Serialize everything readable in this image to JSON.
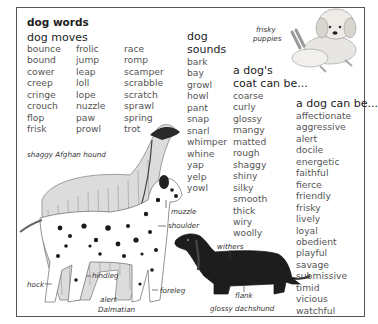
{
  "title": "dog words",
  "sections": {
    "moves": {
      "heading": "dog moves",
      "columns": [
        [
          "bounce",
          "bound",
          "cower",
          "creep",
          "cringe",
          "crouch",
          "flop",
          "frisk"
        ],
        [
          "frolic",
          "jump",
          "leap",
          "loll",
          "lope",
          "nuzzle",
          "paw",
          "prowl"
        ],
        [
          "race",
          "romp",
          "scamper",
          "scrabble",
          "scratch",
          "sprawl",
          "spring",
          "trot"
        ]
      ]
    },
    "sounds": {
      "heading_line1": "dog",
      "heading_line2": "sounds",
      "words": [
        "bark",
        "bay",
        "growl",
        "howl",
        "pant",
        "snap",
        "snarl",
        "whimper",
        "whine",
        "yap",
        "yelp",
        "yowl"
      ]
    },
    "coat": {
      "heading_line1": "a dog's",
      "heading_line2": "coat can be...",
      "words": [
        "coarse",
        "curly",
        "glossy",
        "mangy",
        "matted",
        "rough",
        "shaggy",
        "shiny",
        "silky",
        "smooth",
        "thick",
        "wiry",
        "woolly"
      ]
    },
    "traits": {
      "heading": "a dog can be...",
      "words": [
        "affectionate",
        "aggressive",
        "alert",
        "docile",
        "energetic",
        "faithful",
        "fierce",
        "friendly",
        "frisky",
        "lively",
        "loyal",
        "obedient",
        "playful",
        "savage",
        "submissive",
        "timid",
        "vicious",
        "watchful"
      ]
    }
  },
  "illustrations": {
    "puppies": {
      "caption_line1": "frisky",
      "caption_line2": "puppies"
    },
    "afghan": {
      "caption": "shaggy Afghan hound"
    },
    "dalmatian": {
      "caption_line1": "alert",
      "caption_line2": "Dalmatian"
    },
    "dachshund": {
      "caption": "glossy dachshund"
    },
    "anatomy_labels": {
      "muzzle": "muzzle",
      "shoulder": "shoulder",
      "withers": "withers",
      "hindleg": "hindleg",
      "hock": "hock",
      "foreleg": "foreleg",
      "flank": "flank"
    }
  }
}
